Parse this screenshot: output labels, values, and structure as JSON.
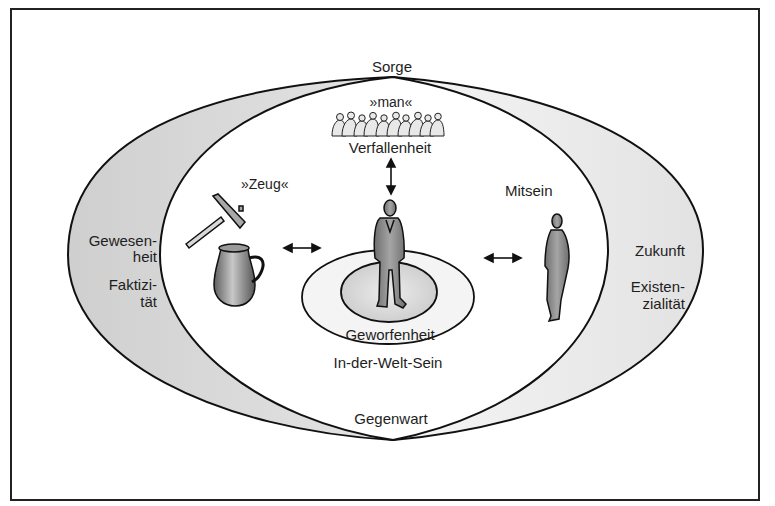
{
  "diagram": {
    "title_top": "Sorge",
    "bottom_apex": "Gegenwart",
    "center": {
      "crowd_label": "»man«",
      "crowd_caption": "Verfallenheit",
      "inner_ring_label": "Geworfenheit",
      "outer_ring_label": "In-der-Welt-Sein"
    },
    "left_inner": {
      "label": "»Zeug«",
      "icons": [
        "hammer-icon",
        "jug-icon"
      ]
    },
    "right_inner": {
      "label": "Mitsein",
      "icons": [
        "person-icon"
      ]
    },
    "left_band": {
      "line1a": "Gewesen-",
      "line1b": "heit",
      "line2a": "Faktizi-",
      "line2b": "tät"
    },
    "right_band": {
      "line1": "Zukunft",
      "line2a": "Existen-",
      "line2b": "zialität"
    },
    "colors": {
      "line": "#111111",
      "band_fill": "#d6d6d6",
      "figure_fill": "#8a8a8a",
      "ring_inner_fill": "#dcdcdc",
      "ring_outer_fill": "#f2f2f2",
      "frame": "#222222"
    }
  }
}
